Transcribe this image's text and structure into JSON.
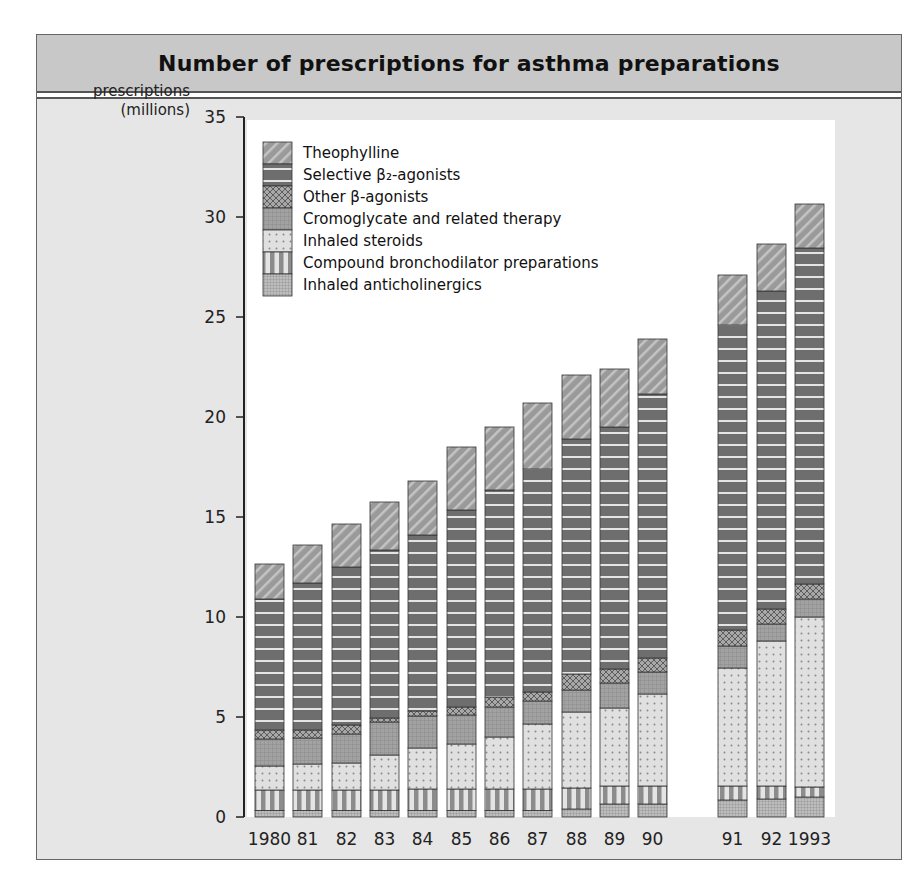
{
  "chart_data": {
    "type": "bar",
    "stacked": true,
    "title": "Number of prescriptions for asthma preparations",
    "ylabel": "prescriptions (millions)",
    "xlabel": "",
    "ylim": [
      0,
      35
    ],
    "yticks": [
      0,
      5,
      10,
      15,
      20,
      25,
      30,
      35
    ],
    "categories": [
      "1980",
      "81",
      "82",
      "83",
      "84",
      "85",
      "86",
      "87",
      "88",
      "89",
      "90",
      "91",
      "92",
      "1993"
    ],
    "legend_position": "top-left",
    "series": [
      {
        "name": "Inhaled anticholinergics",
        "pattern": "fine-grid",
        "values": [
          0.33,
          0.33,
          0.33,
          0.33,
          0.33,
          0.33,
          0.33,
          0.33,
          0.4,
          0.65,
          0.65,
          0.85,
          0.9,
          1.0
        ]
      },
      {
        "name": "Compound bronchodilator preparations",
        "pattern": "vertical-stripes",
        "values": [
          1.02,
          1.02,
          1.02,
          1.02,
          1.07,
          1.07,
          1.07,
          1.07,
          1.05,
          0.9,
          0.9,
          0.7,
          0.65,
          0.5
        ]
      },
      {
        "name": "Inhaled steroids",
        "pattern": "dots",
        "values": [
          1.2,
          1.3,
          1.35,
          1.75,
          2.05,
          2.25,
          2.6,
          3.25,
          3.8,
          3.9,
          4.6,
          5.9,
          7.25,
          8.5
        ]
      },
      {
        "name": "Cromoglycate and related therapy",
        "pattern": "grid",
        "values": [
          1.35,
          1.3,
          1.45,
          1.65,
          1.6,
          1.45,
          1.5,
          1.15,
          1.1,
          1.25,
          1.1,
          1.1,
          0.85,
          0.9
        ]
      },
      {
        "name": "Other β-agonists",
        "pattern": "crosshatch",
        "values": [
          0.45,
          0.4,
          0.45,
          0.2,
          0.25,
          0.4,
          0.5,
          0.45,
          0.8,
          0.7,
          0.7,
          0.8,
          0.75,
          0.75
        ]
      },
      {
        "name": "Selective β2-agonists",
        "pattern": "horizontal-stripes",
        "values": [
          6.55,
          7.35,
          7.9,
          8.4,
          8.8,
          9.85,
          10.35,
          11.15,
          11.75,
          12.1,
          13.2,
          15.25,
          15.9,
          16.8
        ]
      },
      {
        "name": "Theophylline",
        "pattern": "diagonal",
        "values": [
          1.75,
          1.9,
          2.15,
          2.4,
          2.7,
          3.15,
          3.15,
          3.3,
          3.2,
          2.9,
          2.75,
          2.5,
          2.35,
          2.2
        ]
      }
    ],
    "totals": [
      12.65,
      13.6,
      14.65,
      15.75,
      16.8,
      18.5,
      19.5,
      20.7,
      22.1,
      22.4,
      23.9,
      27.1,
      28.65,
      30.65
    ],
    "colors": {
      "bar_dark": "#6e6e6e",
      "bar_mid": "#9a9a9a",
      "bar_light": "#d8d8d8",
      "plot_bg": "#ffffff",
      "panel_bg": "#e6e6e6",
      "header_bg": "#c8c8c8"
    }
  },
  "legend_order": [
    "Theophylline",
    "Selective β₂-agonists",
    "Other β-agonists",
    "Cromoglycate and related therapy",
    "Inhaled steroids",
    "Compound bronchodilator preparations",
    "Inhaled anticholinergics"
  ],
  "ylabel_lines": [
    "prescriptions",
    "(millions)"
  ]
}
